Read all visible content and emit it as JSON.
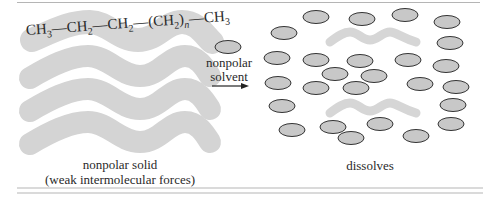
{
  "figure": {
    "molecule": {
      "parts": [
        "CH",
        "3",
        "—CH",
        "2",
        "—CH",
        "2",
        "—(CH",
        "2",
        ")",
        "n",
        "—CH",
        "3"
      ],
      "label": "CH3—CH2—CH2—(CH2)n—CH3"
    },
    "solvent_label_line1": "nonpolar",
    "solvent_label_line2": "solvent",
    "left_caption_line1": "nonpolar solid",
    "left_caption_line2": "(weak intermolecular forces)",
    "right_caption": "dissolves",
    "colors": {
      "wave": "#d4d4d4",
      "molecule_band": "#d6d6d6",
      "solvent_fill": "#c8c8c8",
      "solvent_stroke": "#333333",
      "rule": "#b5b5b5"
    }
  }
}
